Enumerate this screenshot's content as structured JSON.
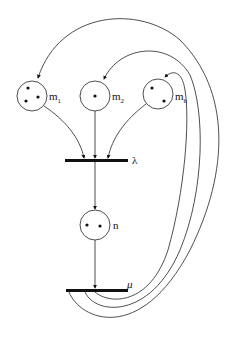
{
  "diagram": {
    "type": "petri-net",
    "places": [
      {
        "id": "m1",
        "label": "m",
        "subscript": "1",
        "tokens": 3
      },
      {
        "id": "m2",
        "label": "m",
        "subscript": "2",
        "tokens": 1
      },
      {
        "id": "mh",
        "label": "m",
        "subscript": "h",
        "tokens": 2
      },
      {
        "id": "n",
        "label": "n",
        "subscript": "",
        "tokens": 2
      }
    ],
    "transitions": [
      {
        "id": "lambda",
        "label": "λ"
      },
      {
        "id": "mu",
        "label": "μ"
      }
    ],
    "arcs": [
      {
        "from": "m1",
        "to": "lambda"
      },
      {
        "from": "m2",
        "to": "lambda"
      },
      {
        "from": "mh",
        "to": "lambda"
      },
      {
        "from": "lambda",
        "to": "n"
      },
      {
        "from": "n",
        "to": "mu"
      },
      {
        "from": "mu",
        "to": "m1"
      },
      {
        "from": "mu",
        "to": "m2"
      },
      {
        "from": "mu",
        "to": "mh"
      }
    ]
  }
}
